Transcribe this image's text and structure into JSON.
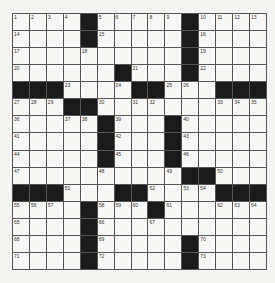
{
  "puzzle": {
    "rows": 15,
    "cols": 15,
    "grid": [
      [
        "1",
        "2",
        "3",
        "4",
        "#",
        "5",
        "6",
        "7",
        "8",
        "9",
        "#",
        "10",
        "11",
        "12",
        "13"
      ],
      [
        "14",
        "",
        "",
        "",
        "#",
        "15",
        "",
        "",
        "",
        "",
        "#",
        "16",
        "",
        "",
        ""
      ],
      [
        "17",
        "",
        "",
        "",
        "18",
        "",
        "",
        "",
        "",
        "",
        "#",
        "19",
        "",
        "",
        ""
      ],
      [
        "20",
        "",
        "",
        "",
        "",
        "",
        "#",
        "21",
        "",
        "",
        "#",
        "22",
        "",
        "",
        ""
      ],
      [
        "#",
        "#",
        "#",
        "23",
        "",
        "",
        "24",
        "#",
        "#",
        "25",
        "26",
        "",
        "#",
        "#",
        "#"
      ],
      [
        "27",
        "28",
        "29",
        "#",
        "#",
        "30",
        "",
        "31",
        "32",
        "",
        "",
        "",
        "33",
        "34",
        "35"
      ],
      [
        "36",
        "",
        "",
        "37",
        "38",
        "#",
        "39",
        "",
        "",
        "#",
        "40",
        "",
        "",
        "",
        ""
      ],
      [
        "41",
        "",
        "",
        "",
        "",
        "#",
        "42",
        "",
        "",
        "#",
        "43",
        "",
        "",
        "",
        ""
      ],
      [
        "44",
        "",
        "",
        "",
        "",
        "#",
        "45",
        "",
        "",
        "#",
        "46",
        "",
        "",
        "",
        ""
      ],
      [
        "47",
        "",
        "",
        "",
        "",
        "48",
        "",
        "",
        "",
        "49",
        "#",
        "#",
        "50",
        "",
        ""
      ],
      [
        "#",
        "#",
        "#",
        "51",
        "",
        "",
        "#",
        "#",
        "52",
        "",
        "53",
        "54",
        "#",
        "#",
        "#"
      ],
      [
        "55",
        "56",
        "57",
        "",
        "#",
        "58",
        "59",
        "60",
        "#",
        "61",
        "",
        "",
        "62",
        "63",
        "64"
      ],
      [
        "65",
        "",
        "",
        "",
        "#",
        "66",
        "",
        "",
        "67",
        "",
        "",
        "",
        "",
        "",
        ""
      ],
      [
        "68",
        "",
        "",
        "",
        "#",
        "69",
        "",
        "",
        "",
        "",
        "#",
        "70",
        "",
        "",
        ""
      ],
      [
        "71",
        "",
        "",
        "",
        "#",
        "72",
        "",
        "",
        "",
        "",
        "#",
        "73",
        "",
        "",
        ""
      ]
    ]
  }
}
